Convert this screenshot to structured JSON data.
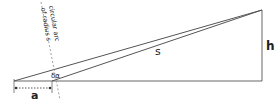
{
  "diagram": {
    "labels": {
      "a": "a",
      "s": "s",
      "h": "h",
      "angle": "δα",
      "arc_line1": "circular arc",
      "arc_line2": "of radius s"
    },
    "colors": {
      "line": "#555555",
      "dashed": "#888888",
      "text": "#222222"
    }
  }
}
